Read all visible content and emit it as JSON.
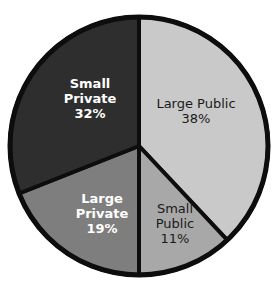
{
  "chart_data": {
    "type": "pie",
    "title": "",
    "subtitle": "",
    "legend": "none",
    "labels_inside_slices": true,
    "categories": [
      "Large Public",
      "Small Public",
      "Large Private",
      "Small Private"
    ],
    "values": [
      38,
      11,
      19,
      32
    ],
    "value_suffix": "%",
    "slices": [
      {
        "name": "Large Public",
        "value": 38,
        "value_label": "38%",
        "color": "#c9c9c9",
        "text_color": "#1a1a1a",
        "start_angle": 0,
        "end_angle": 136.8
      },
      {
        "name": "Small Public",
        "value": 11,
        "value_label": "11%",
        "color": "#a8a8a8",
        "text_color": "#1a1a1a",
        "start_angle": 136.8,
        "end_angle": 180.0
      },
      {
        "name": "Large Private",
        "value": 19,
        "value_label": "19%",
        "color": "#7e7e7e",
        "text_color": "#ffffff",
        "start_angle": 180.0,
        "end_angle": 248.4
      },
      {
        "name": "Small Private",
        "value": 32,
        "value_label": "32%",
        "color": "#2e2e2e",
        "text_color": "#ffffff",
        "start_angle": 248.4,
        "end_angle": 360.0
      }
    ],
    "outline_color": "#0d0d0d",
    "background_color": "#ffffff"
  },
  "labels": {
    "large_public": {
      "line1": "Large Public",
      "value": "38%"
    },
    "small_public": {
      "line1": "Small",
      "line2": "Public",
      "value": "11%"
    },
    "large_private": {
      "line1": "Large",
      "line2": "Private",
      "value": "19%"
    },
    "small_private": {
      "line1": "Small",
      "line2": "Private",
      "value": "32%"
    }
  }
}
